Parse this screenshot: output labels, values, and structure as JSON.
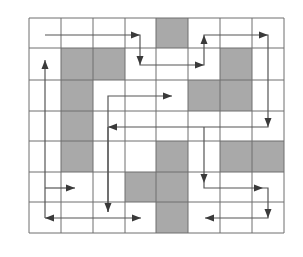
{
  "diagram": {
    "type": "grid-path",
    "columns": 8,
    "rows": 7,
    "x_lines": [
      29,
      61,
      93,
      125,
      156,
      188,
      220,
      252,
      284
    ],
    "y_lines": [
      18,
      48,
      80,
      111,
      141,
      172,
      202,
      233
    ],
    "colors": {
      "background": "#ffffff",
      "grid_line": "#6e6e6e",
      "shaded_cell": "#a9a9a9",
      "path_line": "#555555",
      "arrowhead": "#3a3a3a"
    },
    "shaded_cells": [
      {
        "col": 4,
        "row": 0
      },
      {
        "col": 1,
        "row": 1
      },
      {
        "col": 2,
        "row": 1
      },
      {
        "col": 6,
        "row": 1
      },
      {
        "col": 1,
        "row": 2
      },
      {
        "col": 5,
        "row": 2
      },
      {
        "col": 6,
        "row": 2
      },
      {
        "col": 1,
        "row": 3
      },
      {
        "col": 1,
        "row": 4
      },
      {
        "col": 4,
        "row": 4
      },
      {
        "col": 6,
        "row": 4
      },
      {
        "col": 7,
        "row": 4
      },
      {
        "col": 3,
        "row": 5
      },
      {
        "col": 4,
        "row": 5
      },
      {
        "col": 4,
        "row": 6
      }
    ],
    "paths": [
      {
        "name": "top-route",
        "points": [
          [
            45,
            35
          ],
          [
            140,
            35
          ],
          [
            140,
            65
          ],
          [
            204,
            65
          ],
          [
            204,
            35
          ],
          [
            268,
            35
          ],
          [
            268,
            127
          ],
          [
            108,
            127
          ]
        ],
        "arrows": [
          [
            140,
            35,
            "right"
          ],
          [
            140,
            65,
            "down"
          ],
          [
            204,
            65,
            "right"
          ],
          [
            204,
            35,
            "up"
          ],
          [
            268,
            35,
            "right"
          ],
          [
            268,
            127,
            "down"
          ],
          [
            108,
            127,
            "left"
          ]
        ]
      },
      {
        "name": "middle-up-route",
        "points": [
          [
            108,
            212
          ],
          [
            108,
            96
          ],
          [
            172,
            96
          ]
        ],
        "arrows": [
          [
            172,
            96,
            "right"
          ]
        ]
      },
      {
        "name": "middle-down-route",
        "points": [
          [
            108,
            127
          ],
          [
            108,
            212
          ]
        ],
        "arrows": [
          [
            108,
            212,
            "down"
          ]
        ]
      },
      {
        "name": "left-vertical",
        "points": [
          [
            45,
            218
          ],
          [
            45,
            60
          ]
        ],
        "arrows": [
          [
            45,
            60,
            "up"
          ]
        ]
      },
      {
        "name": "left-short",
        "points": [
          [
            45,
            188
          ],
          [
            75,
            188
          ]
        ],
        "arrows": [
          [
            75,
            188,
            "right"
          ]
        ]
      },
      {
        "name": "bottom-double",
        "points": [
          [
            45,
            218
          ],
          [
            141,
            218
          ]
        ],
        "arrows": [
          [
            45,
            218,
            "left"
          ],
          [
            141,
            218,
            "right"
          ]
        ]
      },
      {
        "name": "right-route",
        "points": [
          [
            204,
            127
          ],
          [
            204,
            188
          ],
          [
            268,
            188
          ],
          [
            268,
            218
          ],
          [
            205,
            218
          ]
        ],
        "arrows": [
          [
            204,
            183,
            "down"
          ],
          [
            263,
            188,
            "right"
          ],
          [
            268,
            218,
            "down"
          ],
          [
            205,
            218,
            "left"
          ]
        ]
      }
    ]
  }
}
